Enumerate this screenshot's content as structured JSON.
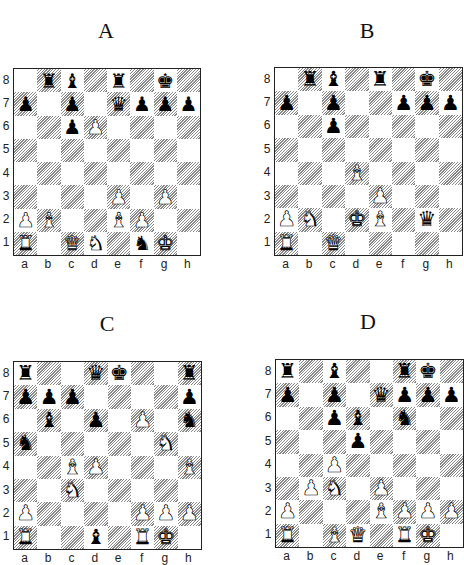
{
  "boards": [
    {
      "id": "A",
      "label": "A",
      "files": [
        "a",
        "b",
        "c",
        "d",
        "e",
        "f",
        "g",
        "h"
      ],
      "ranks": [
        "8",
        "7",
        "6",
        "5",
        "4",
        "3",
        "2",
        "1"
      ],
      "pieces": {
        "b8": "bR",
        "c8": "bB",
        "e8": "bR",
        "g8": "bK",
        "a7": "bP",
        "c7": "bP",
        "e7": "bQ",
        "f7": "bP",
        "g7": "bP",
        "h7": "bP",
        "c6": "bP",
        "d6": "wP",
        "e3": "wP",
        "g3": "wP",
        "a2": "wP",
        "b2": "wB",
        "e2": "wB",
        "f2": "wP",
        "a1": "wR",
        "c1": "wQ",
        "d1": "wN",
        "f1": "bN",
        "g1": "wK"
      }
    },
    {
      "id": "B",
      "label": "B",
      "files": [
        "a",
        "b",
        "c",
        "d",
        "e",
        "f",
        "g",
        "h"
      ],
      "ranks": [
        "8",
        "7",
        "6",
        "5",
        "4",
        "3",
        "2",
        "1"
      ],
      "pieces": {
        "b8": "bR",
        "c8": "bB",
        "e8": "bR",
        "g8": "bK",
        "a7": "bP",
        "c7": "bP",
        "f7": "bP",
        "g7": "bP",
        "h7": "bP",
        "c6": "bP",
        "d4": "wB",
        "e3": "wP",
        "a2": "wP",
        "b2": "wN",
        "d2": "wK",
        "e2": "wB",
        "g2": "bQ",
        "a1": "wR",
        "c1": "wQ"
      }
    },
    {
      "id": "C",
      "label": "C",
      "files": [
        "a",
        "b",
        "c",
        "d",
        "e",
        "f",
        "g",
        "h"
      ],
      "ranks": [
        "8",
        "7",
        "6",
        "5",
        "4",
        "3",
        "2",
        "1"
      ],
      "pieces": {
        "a8": "bR",
        "d8": "bQ",
        "e8": "bK",
        "h8": "bR",
        "a7": "bP",
        "b7": "bP",
        "c7": "bP",
        "h7": "bP",
        "b6": "bB",
        "d6": "bP",
        "f6": "wP",
        "h6": "bN",
        "a5": "bN",
        "g5": "wN",
        "c4": "wB",
        "d4": "wP",
        "h4": "wB",
        "c3": "wN",
        "a2": "wP",
        "f2": "wP",
        "g2": "wP",
        "h2": "wP",
        "a1": "wR",
        "d1": "bB",
        "f1": "wR",
        "g1": "wK"
      }
    },
    {
      "id": "D",
      "label": "D",
      "files": [
        "a",
        "b",
        "c",
        "d",
        "e",
        "f",
        "g",
        "h"
      ],
      "ranks": [
        "8",
        "7",
        "6",
        "5",
        "4",
        "3",
        "2",
        "1"
      ],
      "pieces": {
        "a8": "bR",
        "c8": "bB",
        "f8": "bR",
        "g8": "bK",
        "a7": "bP",
        "c7": "bP",
        "e7": "bQ",
        "f7": "bP",
        "g7": "bP",
        "h7": "bP",
        "c6": "bP",
        "d6": "bB",
        "f6": "bN",
        "d5": "bP",
        "c4": "wP",
        "b3": "wP",
        "c3": "wN",
        "e3": "wP",
        "a2": "wP",
        "e2": "wB",
        "f2": "wP",
        "g2": "wP",
        "h2": "wP",
        "a1": "wR",
        "c1": "wB",
        "d1": "wQ",
        "f1": "wR",
        "g1": "wK"
      }
    }
  ],
  "glyphs": {
    "K": "♚",
    "Q": "♛",
    "R": "♜",
    "B": "♝",
    "N": "♞",
    "P": "♟"
  },
  "piece_names": {
    "K": "king",
    "Q": "queen",
    "R": "rook",
    "B": "bishop",
    "N": "knight",
    "P": "pawn"
  }
}
